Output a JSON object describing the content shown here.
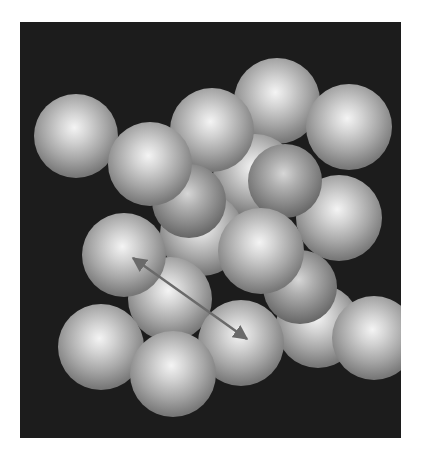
{
  "figure": {
    "background_color": "#1c1c1c",
    "sphere_color": "#b0b0b0",
    "arrow_color": "#6a6a6a",
    "arrow": {
      "x1": 113,
      "y1": 236,
      "x2": 227,
      "y2": 317,
      "double_headed": true
    }
  }
}
